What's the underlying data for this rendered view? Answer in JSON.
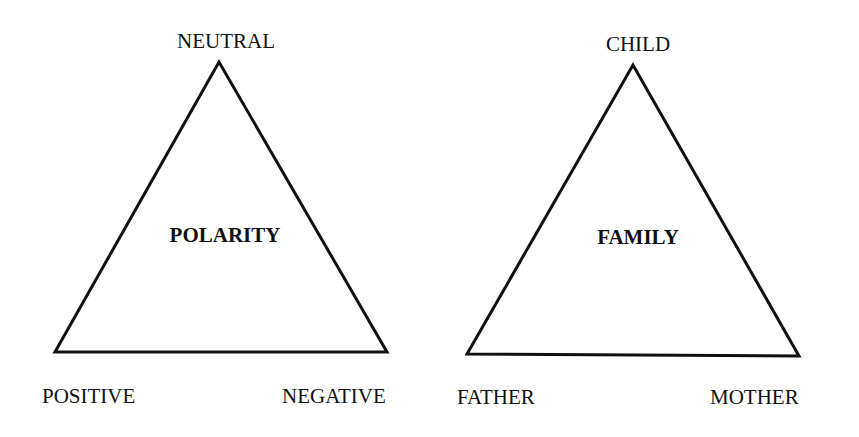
{
  "diagrams": [
    {
      "id": "polarity",
      "center_label": "POLARITY",
      "vertices": {
        "top": "NEUTRAL",
        "bottom_left": "POSITIVE",
        "bottom_right": "NEGATIVE"
      }
    },
    {
      "id": "family",
      "center_label": "FAMILY",
      "vertices": {
        "top": "CHILD",
        "bottom_left": "FATHER",
        "bottom_right": "MOTHER"
      }
    }
  ],
  "colors": {
    "line": "#111111",
    "text": "#111111",
    "background": "#ffffff"
  }
}
